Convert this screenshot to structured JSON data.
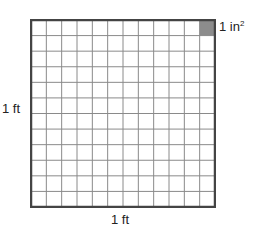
{
  "diagram": {
    "type": "square-grid",
    "rows": 12,
    "cols": 12,
    "shaded_cell": {
      "row": 0,
      "col": 11
    },
    "colors": {
      "border": "#444444",
      "grid_line": "#8a8a8a",
      "shaded": "#8c8c8c",
      "background": "#ffffff"
    },
    "labels": {
      "unit_base": "1 in",
      "unit_exp": "2",
      "side_left": "1 ft",
      "side_bottom": "1 ft"
    }
  }
}
